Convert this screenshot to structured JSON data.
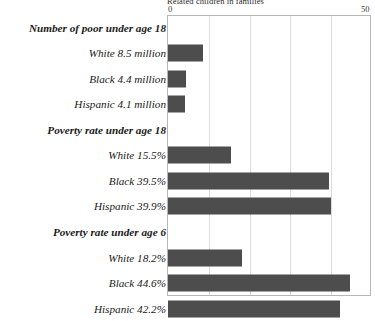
{
  "chart_data": {
    "type": "bar",
    "orientation": "horizontal",
    "title": "Related children in families",
    "xlabel": "",
    "ylabel": "",
    "xlim": [
      0,
      50
    ],
    "xticks": [
      0,
      50
    ],
    "xticklabels": [
      "0",
      "50"
    ],
    "gridlines": [
      10,
      20,
      30,
      40
    ],
    "grid": true,
    "legend": false,
    "bar_color": "#4d4d4d",
    "frame_color": "#b6b6b6",
    "grid_color": "#dcdcdc",
    "sections": [
      {
        "heading": "Number of poor under age 18",
        "unit": "million",
        "categories": [
          "White",
          "Black",
          "Hispanic"
        ],
        "values": [
          8.5,
          4.4,
          4.1
        ],
        "labels": [
          "White  8.5 million",
          "Black  4.4 million",
          "Hispanic  4.1 million"
        ]
      },
      {
        "heading": "Poverty rate under age 18",
        "unit": "percent",
        "categories": [
          "White",
          "Black",
          "Hispanic"
        ],
        "values": [
          15.5,
          39.5,
          39.9
        ],
        "labels": [
          "White  15.5%",
          "Black  39.5%",
          "Hispanic  39.9%"
        ]
      },
      {
        "heading": "Poverty rate under age  6",
        "unit": "percent",
        "categories": [
          "White",
          "Black",
          "Hispanic"
        ],
        "values": [
          18.2,
          44.6,
          42.2
        ],
        "labels": [
          "White  18.2%",
          "Black  44.6%",
          "Hispanic  42.2%"
        ]
      }
    ],
    "rows": [
      {
        "kind": "section",
        "label": "Number of poor under age 18",
        "value": null
      },
      {
        "kind": "bar",
        "label": "White  8.5 million",
        "value": 8.5
      },
      {
        "kind": "bar",
        "label": "Black  4.4 million",
        "value": 4.4
      },
      {
        "kind": "bar",
        "label": "Hispanic  4.1 million",
        "value": 4.1
      },
      {
        "kind": "section",
        "label": "Poverty rate under age 18",
        "value": null
      },
      {
        "kind": "bar",
        "label": "White  15.5%",
        "value": 15.5
      },
      {
        "kind": "bar",
        "label": "Black  39.5%",
        "value": 39.5
      },
      {
        "kind": "bar",
        "label": "Hispanic  39.9%",
        "value": 39.9
      },
      {
        "kind": "section",
        "label": "Poverty rate under age  6",
        "value": null
      },
      {
        "kind": "bar",
        "label": "White  18.2%",
        "value": 18.2
      },
      {
        "kind": "bar",
        "label": "Black  44.6%",
        "value": 44.6
      },
      {
        "kind": "bar",
        "label": "Hispanic  42.2%",
        "value": 42.2
      }
    ]
  }
}
